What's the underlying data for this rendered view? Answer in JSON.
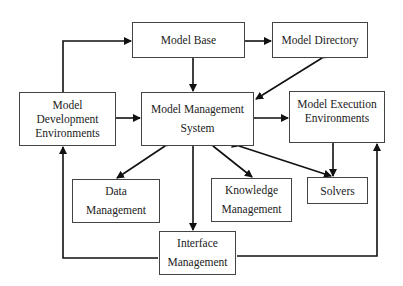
{
  "diagram": {
    "nodes": {
      "model_base": {
        "lines": [
          "Model Base"
        ]
      },
      "model_directory": {
        "lines": [
          "Model Directory"
        ]
      },
      "model_dev_env": {
        "lines": [
          "Model",
          "Development",
          "Environments"
        ]
      },
      "mms": {
        "lines": [
          "Model Management",
          "System"
        ]
      },
      "model_exec_env": {
        "lines": [
          "Model Execution",
          "Environments"
        ]
      },
      "data_mgmt": {
        "lines": [
          "Data",
          "Management"
        ]
      },
      "knowledge_mgmt": {
        "lines": [
          "Knowledge",
          "Management"
        ]
      },
      "solvers": {
        "lines": [
          "Solvers"
        ]
      },
      "interface_mgmt": {
        "lines": [
          "Interface",
          "Management"
        ]
      }
    },
    "edges": [
      {
        "from": "Model Development Environments",
        "to": "Model Base",
        "type": "directed"
      },
      {
        "from": "Model Base",
        "to": "Model Directory",
        "type": "bidirectional"
      },
      {
        "from": "Model Base",
        "to": "Model Management System",
        "type": "bidirectional"
      },
      {
        "from": "Model Directory",
        "to": "Model Management System",
        "type": "bidirectional"
      },
      {
        "from": "Model Development Environments",
        "to": "Model Management System",
        "type": "bidirectional"
      },
      {
        "from": "Model Management System",
        "to": "Model Execution Environments",
        "type": "bidirectional"
      },
      {
        "from": "Model Management System",
        "to": "Data Management",
        "type": "bidirectional"
      },
      {
        "from": "Model Management System",
        "to": "Knowledge Management",
        "type": "bidirectional"
      },
      {
        "from": "Model Management System",
        "to": "Solvers",
        "type": "bidirectional"
      },
      {
        "from": "Model Management System",
        "to": "Interface Management",
        "type": "bidirectional"
      },
      {
        "from": "Solvers",
        "to": "Model Execution Environments",
        "type": "bidirectional"
      },
      {
        "from": "Interface Management",
        "to": "Model Development Environments",
        "type": "directed"
      },
      {
        "from": "Interface Management",
        "to": "Model Execution Environments",
        "type": "directed"
      }
    ]
  }
}
